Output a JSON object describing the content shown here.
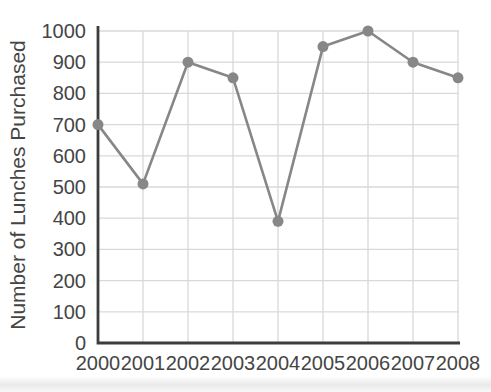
{
  "chart_data": {
    "type": "line",
    "title": "",
    "xlabel": "",
    "ylabel": "Number of Lunches Purchased",
    "categories": [
      "2000",
      "2001",
      "2002",
      "2003",
      "2004",
      "2005",
      "2006",
      "2007",
      "2008"
    ],
    "series": [
      {
        "name": "Number of Lunches Purchased",
        "values": [
          700,
          510,
          900,
          850,
          390,
          950,
          1000,
          900,
          850
        ]
      }
    ],
    "ylim": [
      0,
      1000
    ],
    "yticks": [
      0,
      100,
      200,
      300,
      400,
      500,
      600,
      700,
      800,
      900,
      1000
    ],
    "grid": "on",
    "legend": "none",
    "marker": "circle",
    "colors": {
      "series": "#878787",
      "grid": "#d9d9d9",
      "axis": "#3d3d3d",
      "text": "#454545",
      "background": "#ffffff"
    }
  }
}
